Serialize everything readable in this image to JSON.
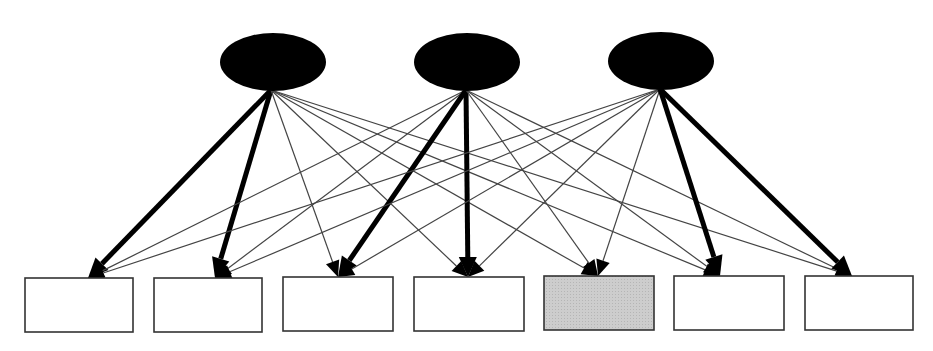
{
  "diagram": {
    "type": "factor-model",
    "colors": {
      "background": "#ffffff",
      "factor_fill": "#000000",
      "box_stroke": "#333333",
      "box_fill": "#ffffff",
      "highlight_box_fill": "#c8c8c8",
      "thin_edge": "#444444",
      "thick_edge": "#000000"
    },
    "factors": [
      {
        "id": "F1",
        "label": "",
        "cx": 273,
        "cy": 62,
        "rx": 53,
        "ry": 29,
        "anchor_x": 271,
        "anchor_y": 90
      },
      {
        "id": "F2",
        "label": "",
        "cx": 467,
        "cy": 62,
        "rx": 53,
        "ry": 29,
        "anchor_x": 466,
        "anchor_y": 90
      },
      {
        "id": "F3",
        "label": "",
        "cx": 661,
        "cy": 61,
        "rx": 53,
        "ry": 29,
        "anchor_x": 660,
        "anchor_y": 89
      }
    ],
    "indicators": [
      {
        "id": "X1",
        "label": "",
        "x": 25,
        "y": 278,
        "w": 108,
        "h": 54,
        "highlighted": false,
        "anchor_x": 88,
        "anchor_y": 278
      },
      {
        "id": "X2",
        "label": "",
        "x": 154,
        "y": 278,
        "w": 108,
        "h": 54,
        "highlighted": false,
        "anchor_x": 215,
        "anchor_y": 278
      },
      {
        "id": "X3",
        "label": "",
        "x": 283,
        "y": 277,
        "w": 110,
        "h": 54,
        "highlighted": false,
        "anchor_x": 338,
        "anchor_y": 277
      },
      {
        "id": "X4",
        "label": "",
        "x": 414,
        "y": 277,
        "w": 110,
        "h": 54,
        "highlighted": false,
        "anchor_x": 468,
        "anchor_y": 277
      },
      {
        "id": "X5",
        "label": "",
        "x": 544,
        "y": 276,
        "w": 110,
        "h": 54,
        "highlighted": true,
        "anchor_x": 598,
        "anchor_y": 276
      },
      {
        "id": "X6",
        "label": "",
        "x": 674,
        "y": 276,
        "w": 110,
        "h": 54,
        "highlighted": false,
        "anchor_x": 720,
        "anchor_y": 276
      },
      {
        "id": "X7",
        "label": "",
        "x": 805,
        "y": 276,
        "w": 108,
        "h": 54,
        "highlighted": false,
        "anchor_x": 852,
        "anchor_y": 276
      }
    ],
    "edges": [
      {
        "from": "F1",
        "to": "X1",
        "weight": "thick"
      },
      {
        "from": "F1",
        "to": "X2",
        "weight": "thick"
      },
      {
        "from": "F1",
        "to": "X3",
        "weight": "thin"
      },
      {
        "from": "F1",
        "to": "X4",
        "weight": "thin"
      },
      {
        "from": "F1",
        "to": "X5",
        "weight": "thin"
      },
      {
        "from": "F1",
        "to": "X6",
        "weight": "thin"
      },
      {
        "from": "F1",
        "to": "X7",
        "weight": "thin"
      },
      {
        "from": "F2",
        "to": "X1",
        "weight": "thin"
      },
      {
        "from": "F2",
        "to": "X2",
        "weight": "thin"
      },
      {
        "from": "F2",
        "to": "X3",
        "weight": "thick"
      },
      {
        "from": "F2",
        "to": "X4",
        "weight": "thick"
      },
      {
        "from": "F2",
        "to": "X5",
        "weight": "thin"
      },
      {
        "from": "F2",
        "to": "X6",
        "weight": "thin"
      },
      {
        "from": "F2",
        "to": "X7",
        "weight": "thin"
      },
      {
        "from": "F3",
        "to": "X1",
        "weight": "thin"
      },
      {
        "from": "F3",
        "to": "X2",
        "weight": "thin"
      },
      {
        "from": "F3",
        "to": "X3",
        "weight": "thin"
      },
      {
        "from": "F3",
        "to": "X4",
        "weight": "thin"
      },
      {
        "from": "F3",
        "to": "X5",
        "weight": "thin"
      },
      {
        "from": "F3",
        "to": "X6",
        "weight": "thick"
      },
      {
        "from": "F3",
        "to": "X7",
        "weight": "thick"
      }
    ]
  }
}
